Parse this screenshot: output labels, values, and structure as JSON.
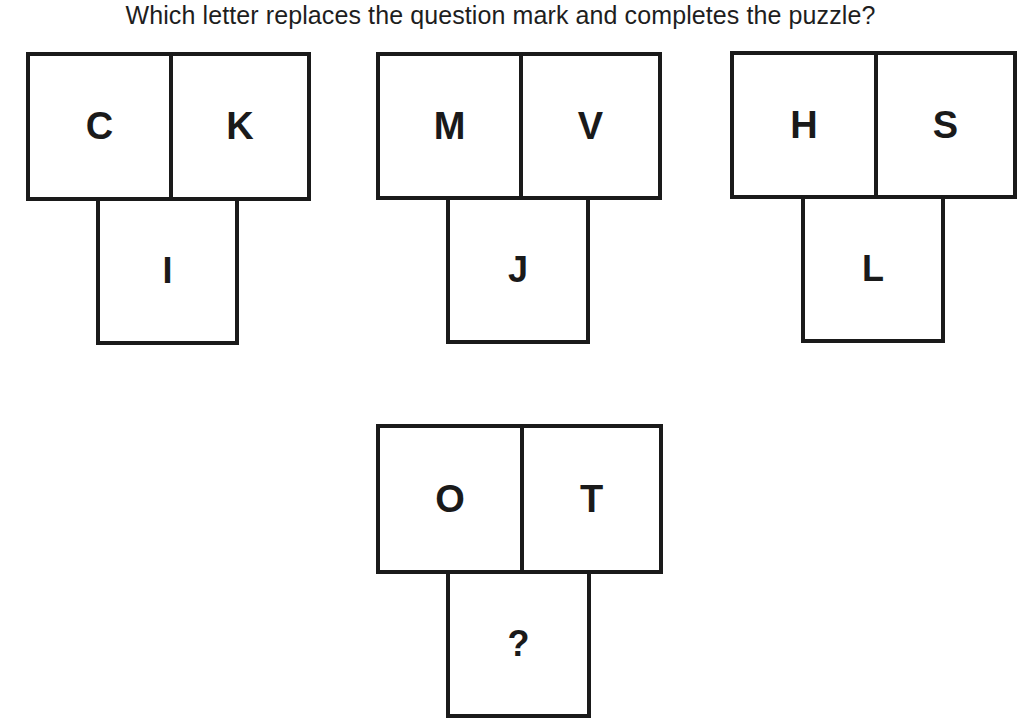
{
  "question": "Which letter replaces the question mark and completes the puzzle?",
  "puzzles": [
    {
      "top_left": "C",
      "top_right": "K",
      "bottom": "I"
    },
    {
      "top_left": "M",
      "top_right": "V",
      "bottom": "J"
    },
    {
      "top_left": "H",
      "top_right": "S",
      "bottom": "L"
    },
    {
      "top_left": "O",
      "top_right": "T",
      "bottom": "?"
    }
  ]
}
